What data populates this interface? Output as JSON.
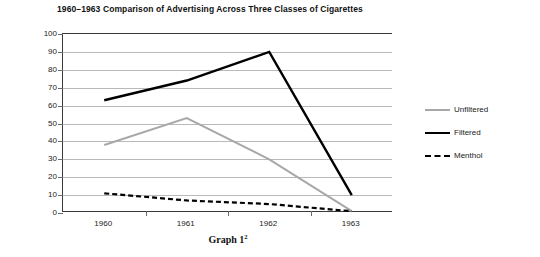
{
  "chart_data": {
    "type": "line",
    "title": "1960–1963 Comparison of Advertising Across Three Classes of Cigarettes",
    "caption": "Graph 1",
    "caption_superscript": "2",
    "xlabel": "",
    "ylabel": "",
    "categories": [
      "1960",
      "1961",
      "1962",
      "1963"
    ],
    "x": [
      1960,
      1961,
      1962,
      1963
    ],
    "ylim": [
      0,
      100
    ],
    "ytick_labels": [
      "100",
      "90",
      "80",
      "70",
      "60",
      "50",
      "40",
      "30",
      "20",
      "10",
      "0"
    ],
    "ytick_values": [
      100,
      90,
      80,
      70,
      60,
      50,
      40,
      30,
      20,
      10,
      0
    ],
    "grid": true,
    "legend_position": "right",
    "series": [
      {
        "name": "Unfiltered",
        "values": [
          38,
          53,
          30,
          1
        ],
        "color": "#a8a8a8",
        "style": "solid",
        "width": 2
      },
      {
        "name": "Filtered",
        "values": [
          63,
          74,
          90,
          10
        ],
        "color": "#000000",
        "style": "solid",
        "width": 2.4
      },
      {
        "name": "Menthol",
        "values": [
          11,
          7,
          5,
          1
        ],
        "color": "#000000",
        "style": "dashed",
        "width": 2.2
      }
    ]
  },
  "legend": {
    "items": [
      {
        "label": "Unfiltered"
      },
      {
        "label": "Filtered"
      },
      {
        "label": "Menthol"
      }
    ]
  },
  "colors": {
    "axis": "#3a3a3a",
    "grid": "#b9b9b9",
    "text": "#1a1a1a",
    "background": "#ffffff",
    "unfiltered": "#a8a8a8",
    "filtered": "#000000",
    "menthol": "#000000"
  }
}
